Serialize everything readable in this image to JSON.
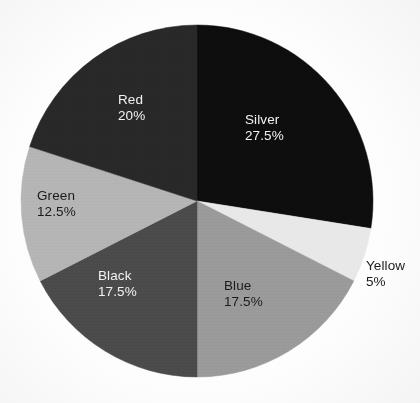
{
  "chart_data": {
    "type": "pie",
    "title": "",
    "subtitle": "",
    "xlabel": "",
    "ylabel": "",
    "grid": false,
    "legend": "none",
    "label_format": "name + percent inside slice",
    "start_angle_deg": 0,
    "direction": "clockwise",
    "categories": [
      "Silver",
      "Yellow",
      "Blue",
      "Black",
      "Green",
      "Red"
    ],
    "values": [
      27.5,
      5,
      17.5,
      17.5,
      12.5,
      20
    ],
    "total": 100,
    "units": "%",
    "slices": [
      {
        "name": "Silver",
        "value": 27.5,
        "value_label": "27.5%",
        "fill": "#0d0d0d",
        "text_color": "#f2f2f2",
        "label_placement": "inside",
        "start_deg": 0,
        "end_deg": 99,
        "label_x": 245,
        "label_y": 112
      },
      {
        "name": "Yellow",
        "value": 5,
        "value_label": "5%",
        "fill": "#e8e8e8",
        "text_color": "#1a1a1a",
        "label_placement": "outside",
        "start_deg": 99,
        "end_deg": 117,
        "label_x": 366,
        "label_y": 258
      },
      {
        "name": "Blue",
        "value": 17.5,
        "value_label": "17.5%",
        "fill": "#999999",
        "text_color": "#1a1a1a",
        "label_placement": "inside",
        "start_deg": 117,
        "end_deg": 180,
        "label_x": 224,
        "label_y": 278
      },
      {
        "name": "Black",
        "value": 17.5,
        "value_label": "17.5%",
        "fill": "#4a4a4a",
        "text_color": "#f2f2f2",
        "label_placement": "inside",
        "start_deg": 180,
        "end_deg": 243,
        "label_x": 98,
        "label_y": 268
      },
      {
        "name": "Green",
        "value": 12.5,
        "value_label": "12.5%",
        "fill": "#b4b4b4",
        "text_color": "#1a1a1a",
        "label_placement": "inside",
        "start_deg": 243,
        "end_deg": 288,
        "label_x": 37,
        "label_y": 188
      },
      {
        "name": "Red",
        "value": 20,
        "value_label": "20%",
        "fill": "#282828",
        "text_color": "#f2f2f2",
        "label_placement": "inside",
        "start_deg": 288,
        "end_deg": 360,
        "label_x": 118,
        "label_y": 92
      }
    ],
    "geometry": {
      "center_x": 197,
      "center_y": 201,
      "radius": 176
    },
    "background_color": "#fdfdfd"
  }
}
